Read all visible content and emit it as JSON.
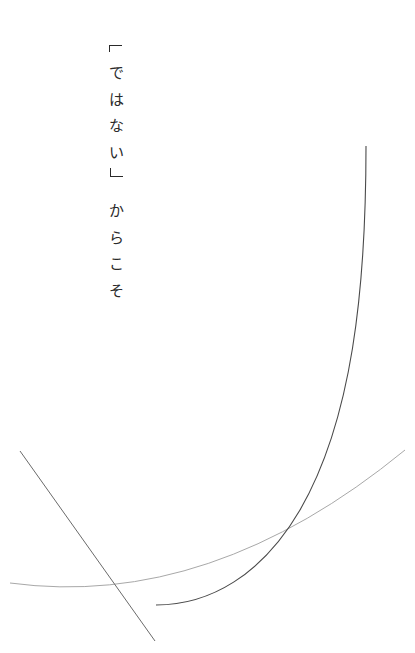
{
  "poster": {
    "headline": {
      "open_bracket": "「",
      "chars_quoted": [
        "で",
        "は",
        "な",
        "い"
      ],
      "close_bracket": "」",
      "chars_after": [
        "か",
        "ら",
        "こ",
        "そ"
      ],
      "full_text": "「ではない」からこそ",
      "orientation": "vertical"
    },
    "colors": {
      "background": "#ffffff",
      "text": "#2a2a2a",
      "dark_line": "#4a4a4a",
      "mid_line": "#6a6a6a",
      "light_line": "#a8a8a8"
    },
    "graphics": [
      {
        "name": "large-curve",
        "description": "dark curve descending from top-right and sweeping left at bottom"
      },
      {
        "name": "wide-arc",
        "description": "light gray shallow arc rising to the right"
      },
      {
        "name": "diagonal-line",
        "description": "straight line from upper-left down to bottom-center"
      }
    ]
  }
}
